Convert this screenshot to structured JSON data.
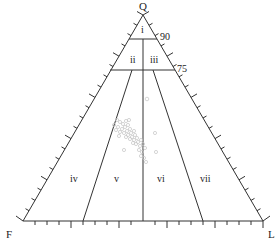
{
  "diagram": {
    "type": "ternary-classification",
    "apices": {
      "top": "Q",
      "left": "F",
      "right": "L"
    },
    "level_labels": [
      "90",
      "75"
    ],
    "fields": [
      {
        "id": "i",
        "label": "i"
      },
      {
        "id": "ii",
        "label": "ii"
      },
      {
        "id": "iii",
        "label": "iii"
      },
      {
        "id": "iv",
        "label": "iv"
      },
      {
        "id": "v",
        "label": "v"
      },
      {
        "id": "vi",
        "label": "vi"
      },
      {
        "id": "vii",
        "label": "vii"
      }
    ],
    "colors": {
      "line": "#333333",
      "points": "#bdbdbd"
    }
  }
}
